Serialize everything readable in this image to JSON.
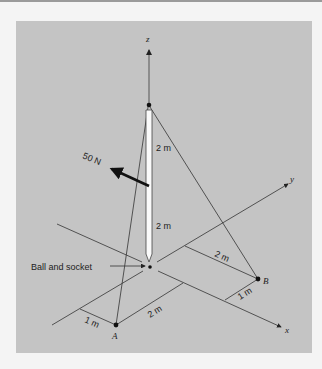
{
  "figure": {
    "axes": {
      "x": "x",
      "y": "y",
      "z": "z"
    },
    "points": {
      "A": "A",
      "B": "B"
    },
    "force_label": "50 N",
    "pole_upper_length": "2 m",
    "pole_lower_length": "2 m",
    "support_label": "Ball and socket",
    "dim_B_y": "2 m",
    "dim_B_x": "1 m",
    "dim_A_x": "2 m",
    "dim_A_y": "1 m"
  }
}
